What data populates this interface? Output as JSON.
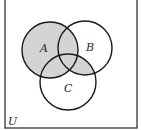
{
  "diagram": {
    "type": "venn",
    "universe_label": "U",
    "sets": [
      {
        "name": "A",
        "label": "A"
      },
      {
        "name": "B",
        "label": "B"
      },
      {
        "name": "C",
        "label": "C"
      }
    ],
    "shaded_region": "A ∪ (B ∩ C)",
    "colors": {
      "shade": "#d4d4d4",
      "stroke": "#1a1a1a",
      "background": "#ffffff"
    }
  }
}
